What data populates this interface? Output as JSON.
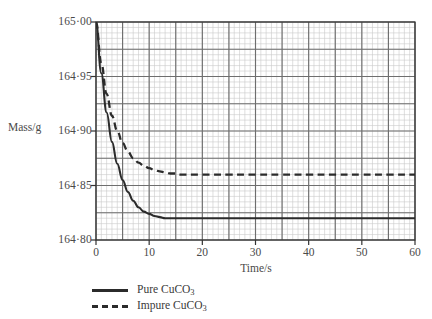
{
  "chart_data": {
    "type": "line",
    "title": "",
    "subtitle": "",
    "xlabel": "Time/s",
    "ylabel": "Mass/g",
    "xlim": [
      0,
      60
    ],
    "ylim": [
      164.8,
      165.0
    ],
    "x_ticks": [
      "0",
      "10",
      "20",
      "30",
      "40",
      "50",
      "60"
    ],
    "x_tick_values": [
      0,
      10,
      20,
      30,
      40,
      50,
      60
    ],
    "y_ticks": [
      "164·80",
      "164·85",
      "164·90",
      "164·95",
      "165·00"
    ],
    "y_tick_values": [
      164.8,
      164.85,
      164.9,
      164.95,
      165.0
    ],
    "grid": true,
    "grid_major_x_step": 5,
    "grid_minor_x_step": 1,
    "grid_major_y_step": 0.025,
    "grid_minor_y_step": 0.005,
    "legend_position": "bottom-left",
    "series": [
      {
        "name": "Pure CuCO3",
        "label_text": "Pure CuCO",
        "label_sub": "3",
        "style": "solid",
        "color": "#2b2b2b",
        "start_value": 165.0,
        "asymptote": 164.82,
        "x": [
          0,
          1,
          2,
          3,
          4,
          5,
          6,
          7,
          8,
          9,
          10,
          11,
          12,
          13,
          14,
          15,
          16,
          17,
          18,
          20,
          25,
          30,
          35,
          40,
          45,
          50,
          55,
          60
        ],
        "values": [
          165.0,
          164.953,
          164.917,
          164.89,
          164.87,
          164.855,
          164.844,
          164.836,
          164.83,
          164.826,
          164.824,
          164.822,
          164.821,
          164.82,
          164.82,
          164.82,
          164.82,
          164.82,
          164.82,
          164.82,
          164.82,
          164.82,
          164.82,
          164.82,
          164.82,
          164.82,
          164.82,
          164.82
        ]
      },
      {
        "name": "Impure CuCO3",
        "label_text": "Impure CuCO",
        "label_sub": "3",
        "style": "dashed",
        "color": "#2b2b2b",
        "start_value": 165.0,
        "asymptote": 164.86,
        "x": [
          0,
          1,
          2,
          3,
          4,
          5,
          6,
          7,
          8,
          9,
          10,
          11,
          12,
          13,
          14,
          15,
          16,
          18,
          20,
          25,
          30,
          35,
          40,
          45,
          50,
          55,
          60
        ],
        "values": [
          165.0,
          164.962,
          164.934,
          164.914,
          164.9,
          164.889,
          164.881,
          164.875,
          164.871,
          164.868,
          164.866,
          164.864,
          164.863,
          164.862,
          164.861,
          164.861,
          164.86,
          164.86,
          164.86,
          164.86,
          164.86,
          164.86,
          164.86,
          164.86,
          164.86,
          164.86,
          164.86
        ]
      }
    ],
    "colors": {
      "curve": "#2b2b2b",
      "axis": "#333333",
      "grid_major": "#6e6e6e",
      "grid_minor": "#c9c9c9",
      "text": "#3a3a3a",
      "background": "#ffffff"
    }
  },
  "axes": {
    "y_title": "Mass/g",
    "x_title": "Time/s"
  },
  "legend": {
    "items": [
      {
        "label": "Pure CuCO",
        "sub": "3",
        "style": "solid"
      },
      {
        "label": "Impure CuCO",
        "sub": "3",
        "style": "dashed"
      }
    ]
  }
}
